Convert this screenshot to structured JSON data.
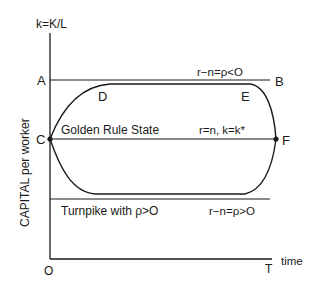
{
  "diagram": {
    "y_axis_label": "k=K/L",
    "y_axis_title": "CAPITAL per worker",
    "x_axis_label": "time",
    "origin_label": "O",
    "end_label": "T",
    "points": {
      "A": "A",
      "B": "B",
      "C": "C",
      "D": "D",
      "E": "E",
      "F": "F"
    },
    "upper_line_label": "r−n=ρ<O",
    "golden_rule_label": "Golden Rule State",
    "golden_rule_condition": "r=n, k=k*",
    "lower_line_label": "Turnpike with ρ>O",
    "lower_line_condition": "r−n=ρ>O",
    "colors": {
      "ink": "#1a1a1a",
      "background": "#ffffff"
    }
  }
}
